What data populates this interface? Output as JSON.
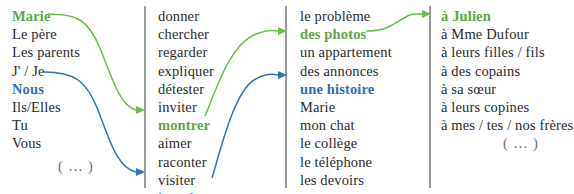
{
  "diagram": {
    "type": "sentence-builder-grid",
    "colors": {
      "green": "#5aa843",
      "blue": "#2f6fb5",
      "text": "#2b2b2b",
      "divider": "#9a9a9a",
      "muted": "#6d6d6d"
    },
    "ellipsis_label": "( … )",
    "columns": [
      {
        "name": "subject",
        "entries": [
          {
            "text": "Marie",
            "highlight": "green"
          },
          {
            "text": "Le père",
            "highlight": "none"
          },
          {
            "text": "Les parents",
            "highlight": "none"
          },
          {
            "text": "J' / Je",
            "highlight": "none"
          },
          {
            "text": "Nous",
            "highlight": "blue"
          },
          {
            "text": "Ils/Elles",
            "highlight": "none"
          },
          {
            "text": "Tu",
            "highlight": "none"
          },
          {
            "text": "Vous",
            "highlight": "none"
          }
        ],
        "has_ellipsis": true
      },
      {
        "name": "verb",
        "entries": [
          {
            "text": "donner",
            "highlight": "none"
          },
          {
            "text": "chercher",
            "highlight": "none"
          },
          {
            "text": "regarder",
            "highlight": "none"
          },
          {
            "text": "expliquer",
            "highlight": "none"
          },
          {
            "text": "détester",
            "highlight": "none"
          },
          {
            "text": "inviter",
            "highlight": "none"
          },
          {
            "text": "montrer",
            "highlight": "green"
          },
          {
            "text": "aimer",
            "highlight": "none"
          },
          {
            "text": "raconter",
            "highlight": "none"
          },
          {
            "text": "visiter",
            "highlight": "none"
          },
          {
            "text": "imaginer",
            "highlight": "blue"
          }
        ],
        "has_ellipsis": false
      },
      {
        "name": "direct-object",
        "entries": [
          {
            "text": "le problème",
            "highlight": "none"
          },
          {
            "text": "des photos",
            "highlight": "green"
          },
          {
            "text": "un appartement",
            "highlight": "none"
          },
          {
            "text": "des annonces",
            "highlight": "none"
          },
          {
            "text": "une histoire",
            "highlight": "blue"
          },
          {
            "text": "Marie",
            "highlight": "none"
          },
          {
            "text": "mon chat",
            "highlight": "none"
          },
          {
            "text": "le collège",
            "highlight": "none"
          },
          {
            "text": "le téléphone",
            "highlight": "none"
          },
          {
            "text": "les devoirs",
            "highlight": "none"
          }
        ],
        "has_ellipsis": true
      },
      {
        "name": "indirect-object",
        "entries": [
          {
            "text": "à Julien",
            "highlight": "green"
          },
          {
            "text": "à Mme Dufour",
            "highlight": "none"
          },
          {
            "text": "à leurs filles / fils",
            "highlight": "none"
          },
          {
            "text": "à des copains",
            "highlight": "none"
          },
          {
            "text": "à sa sœur",
            "highlight": "none"
          },
          {
            "text": "à leurs copines",
            "highlight": "none"
          },
          {
            "text": "à mes / tes / nos frères",
            "highlight": "none"
          }
        ],
        "has_ellipsis": true
      }
    ],
    "connections": [
      {
        "color": "green",
        "from": "Marie",
        "to": "montrer"
      },
      {
        "color": "blue",
        "from": "Nous",
        "to": "imaginer"
      },
      {
        "color": "green",
        "from": "montrer",
        "to": "des photos"
      },
      {
        "color": "blue",
        "from": "imaginer",
        "to": "une histoire"
      },
      {
        "color": "green",
        "from": "des photos",
        "to": "à Julien"
      }
    ]
  }
}
